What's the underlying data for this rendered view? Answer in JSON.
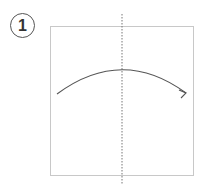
{
  "step": {
    "number": "1"
  },
  "diagram": {
    "type": "origami-fold-instruction",
    "paper_square": {
      "x": 50,
      "y": 26,
      "width": 143,
      "height": 149,
      "stroke": "#c8c8c8"
    },
    "fold_line": {
      "style": "dotted",
      "x": 122,
      "y1": 14,
      "y2": 185,
      "stroke": "#777777"
    },
    "fold_arrow": {
      "from": [
        57,
        94
      ],
      "peak": [
        122,
        70
      ],
      "to": [
        186,
        93
      ],
      "stroke": "#555555",
      "direction": "left-to-right"
    }
  }
}
